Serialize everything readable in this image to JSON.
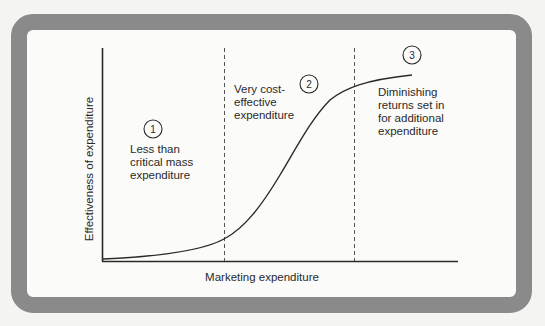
{
  "diagram": {
    "type": "s-curve-with-regions",
    "y_axis_label": "Effectiveness of expenditure",
    "x_axis_label": "Marketing expenditure",
    "regions": [
      {
        "number": "1",
        "lines": [
          "Less than",
          "critical mass",
          "expenditure"
        ]
      },
      {
        "number": "2",
        "lines": [
          "Very cost-",
          "effective",
          "expenditure"
        ]
      },
      {
        "number": "3",
        "lines": [
          "Diminishing",
          "returns set in",
          "for additional",
          "expenditure"
        ]
      }
    ],
    "colors": {
      "frame": "#8a8a8a",
      "line": "#2a2a2a",
      "dashed": "#555555",
      "background": "#fbfbf9"
    }
  }
}
